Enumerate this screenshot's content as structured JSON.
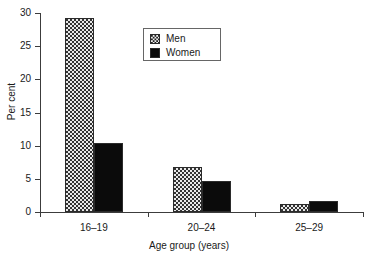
{
  "chart_data": {
    "type": "bar",
    "title": "",
    "subtitle": "",
    "xlabel": "Age group (years)",
    "ylabel": "Per cent",
    "categories": [
      "16–19",
      "20–24",
      "25–29"
    ],
    "series": [
      {
        "name": "Men",
        "values": [
          29.3,
          6.8,
          1.2
        ],
        "pattern": "stipple-dot",
        "color": "#e9e9e9"
      },
      {
        "name": "Women",
        "values": [
          10.4,
          4.7,
          1.6
        ],
        "pattern": "solid",
        "color": "#0b0b0b"
      }
    ],
    "ylim": [
      0,
      30
    ],
    "yticks": [
      0,
      5,
      10,
      15,
      20,
      25,
      30
    ],
    "ytick_labels": [
      "0",
      "5",
      "10",
      "15",
      "20",
      "25",
      "30"
    ],
    "grid": false,
    "legend_position": "top-center",
    "legend_entries": [
      "Men",
      "Women"
    ]
  },
  "axes": {
    "y_title": "Per cent",
    "x_title": "Age group (years)"
  },
  "legend": {
    "items": [
      {
        "label": "Men"
      },
      {
        "label": "Women"
      }
    ]
  }
}
